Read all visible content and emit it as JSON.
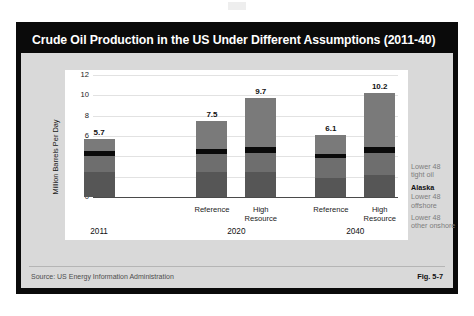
{
  "figure": {
    "title": "Crude Oil Production in the US Under Different Assumptions (2011-40)",
    "source": "Source:  US Energy Information Administration",
    "fig_number": "Fig. 5-7"
  },
  "colors": {
    "frame": "#0a0a0a",
    "panel": "#d9d9d9",
    "plot_background": "#ffffff",
    "tight_oil": "#7a7a7a",
    "alaska": "#0a0a0a",
    "offshore": "#6e6e6e",
    "other_onshore": "#565656",
    "gridline": "#e2e2e2",
    "axis": "#4a4a4a"
  },
  "chart_data": {
    "type": "bar",
    "title": "Crude Oil Production in the US Under Different Assumptions (2011-40)",
    "xlabel": "",
    "ylabel": "Million Barrels Per Day",
    "ylim": [
      0,
      12
    ],
    "yticks": [
      0,
      2,
      4,
      6,
      8,
      10,
      12
    ],
    "grid": true,
    "stacked": true,
    "legend_position": "right",
    "categories": [
      "2011",
      "Reference\n2020",
      "High Resource\n2020",
      "Reference\n2040",
      "High Resource\n2040"
    ],
    "series": [
      {
        "name": "Lower 48 other onshore",
        "values": [
          2.5,
          2.5,
          2.5,
          1.9,
          2.2
        ]
      },
      {
        "name": "Lower 48 offshore",
        "values": [
          1.5,
          1.7,
          1.8,
          1.9,
          2.1
        ]
      },
      {
        "name": "Alaska",
        "values": [
          0.5,
          0.5,
          0.6,
          0.4,
          0.6
        ]
      },
      {
        "name": "Lower 48 tight oil",
        "values": [
          1.2,
          2.8,
          4.8,
          1.9,
          5.3
        ]
      }
    ],
    "totals": [
      5.7,
      7.5,
      9.7,
      6.1,
      10.2
    ],
    "groups": [
      {
        "label": "2011",
        "scenarios": [
          "",
          ""
        ]
      },
      {
        "label": "2020",
        "scenarios": [
          "Reference",
          "High\nResource"
        ]
      },
      {
        "label": "2040",
        "scenarios": [
          "Reference",
          "High\nResource"
        ]
      }
    ]
  },
  "bars": [
    {
      "id": "bar-2011",
      "total": "5.7",
      "scenario": "",
      "group": "2011",
      "left_pct": 2,
      "segments": [
        {
          "name": "other-onshore",
          "value": 2.5,
          "color": "#565656"
        },
        {
          "name": "offshore",
          "value": 1.5,
          "color": "#6e6e6e"
        },
        {
          "name": "alaska",
          "value": 0.5,
          "color": "#0a0a0a"
        },
        {
          "name": "tight-oil",
          "value": 1.2,
          "color": "#7a7a7a"
        }
      ]
    },
    {
      "id": "bar-2020-reference",
      "total": "7.5",
      "scenario": "Reference",
      "group": "2020",
      "left_pct": 39,
      "segments": [
        {
          "name": "other-onshore",
          "value": 2.5,
          "color": "#565656"
        },
        {
          "name": "offshore",
          "value": 1.7,
          "color": "#6e6e6e"
        },
        {
          "name": "alaska",
          "value": 0.5,
          "color": "#0a0a0a"
        },
        {
          "name": "tight-oil",
          "value": 2.8,
          "color": "#7a7a7a"
        }
      ]
    },
    {
      "id": "bar-2020-high-resource",
      "total": "9.7",
      "scenario": "High\nResource",
      "group": "2020",
      "left_pct": 55,
      "segments": [
        {
          "name": "other-onshore",
          "value": 2.5,
          "color": "#565656"
        },
        {
          "name": "offshore",
          "value": 1.8,
          "color": "#6e6e6e"
        },
        {
          "name": "alaska",
          "value": 0.6,
          "color": "#0a0a0a"
        },
        {
          "name": "tight-oil",
          "value": 4.8,
          "color": "#7a7a7a"
        }
      ]
    },
    {
      "id": "bar-2040-reference",
      "total": "6.1",
      "scenario": "Reference",
      "group": "2040",
      "left_pct": 78,
      "segments": [
        {
          "name": "other-onshore",
          "value": 1.9,
          "color": "#565656"
        },
        {
          "name": "offshore",
          "value": 1.9,
          "color": "#6e6e6e"
        },
        {
          "name": "alaska",
          "value": 0.4,
          "color": "#0a0a0a"
        },
        {
          "name": "tight-oil",
          "value": 1.9,
          "color": "#7a7a7a"
        }
      ]
    },
    {
      "id": "bar-2040-high-resource",
      "total": "10.2",
      "scenario": "High\nResource",
      "group": "2040",
      "left_pct": 94,
      "segments": [
        {
          "name": "other-onshore",
          "value": 2.2,
          "color": "#565656"
        },
        {
          "name": "offshore",
          "value": 2.1,
          "color": "#6e6e6e"
        },
        {
          "name": "alaska",
          "value": 0.6,
          "color": "#0a0a0a"
        },
        {
          "name": "tight-oil",
          "value": 5.3,
          "color": "#7a7a7a"
        }
      ]
    }
  ],
  "legend": [
    {
      "label": "Lower 48\ntight oil",
      "bold": false
    },
    {
      "label": "Alaska",
      "bold": true
    },
    {
      "label": "Lower 48\noffshore",
      "bold": false
    },
    {
      "label": "Lower 48\nother onshore",
      "bold": false
    }
  ]
}
